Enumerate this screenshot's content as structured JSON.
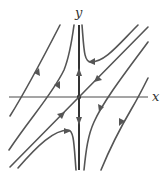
{
  "diagram": {
    "type": "phase-portrait",
    "axes": {
      "x_label": "x",
      "y_label": "y"
    },
    "equilibrium": "saddle at origin",
    "trajectories": [
      {
        "name": "unstable-manifold-y-axis",
        "direction": "away from origin"
      },
      {
        "name": "stable-manifold-diagonal",
        "direction": "toward origin"
      },
      {
        "name": "hyperbola-top-right",
        "direction": "leftward then upward"
      },
      {
        "name": "hyperbola-bottom-left",
        "direction": "rightward then downward"
      },
      {
        "name": "left-curve-outer",
        "direction": "up-right"
      },
      {
        "name": "left-curve-inner",
        "direction": "up-right"
      },
      {
        "name": "right-curve-inner",
        "direction": "down-left"
      },
      {
        "name": "right-curve-outer",
        "direction": "down-left"
      }
    ],
    "colors": {
      "curve": "#555555",
      "axis": "#4a4a4a",
      "background": "#ffffff"
    }
  }
}
